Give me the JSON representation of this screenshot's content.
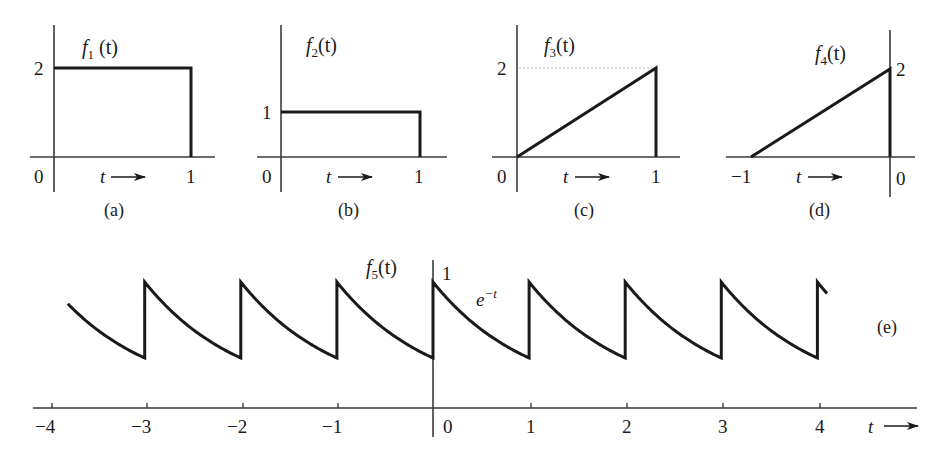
{
  "figure": {
    "panels": [
      {
        "id": "a",
        "caption": "(a)",
        "function_name": "f",
        "function_subscript": "1",
        "function_arg": " (t)",
        "y_tick_label": "2",
        "x_origin_label": "0",
        "x_end_label": "1",
        "t_label": "t"
      },
      {
        "id": "b",
        "caption": "(b)",
        "function_name": "f",
        "function_subscript": "2",
        "function_arg": "(t)",
        "y_tick_label": "1",
        "x_origin_label": "0",
        "x_end_label": "1",
        "t_label": "t"
      },
      {
        "id": "c",
        "caption": "(c)",
        "function_name": "f",
        "function_subscript": "3",
        "function_arg": "(t)",
        "y_tick_label": "2",
        "x_origin_label": "0",
        "x_end_label": "1",
        "t_label": "t"
      },
      {
        "id": "d",
        "caption": "(d)",
        "function_name": "f",
        "function_subscript": "4",
        "function_arg": "(t)",
        "y_tick_label": "2",
        "x_start_label": "−1",
        "x_origin_label": "0",
        "t_label": "t"
      },
      {
        "id": "e",
        "caption": "(e)",
        "function_name": "f",
        "function_subscript": "5",
        "function_arg": "(t)",
        "peak_label": "1",
        "curve_label_base": "e",
        "curve_label_exp": "−t",
        "t_label": "t",
        "x_tick_labels": [
          "−4",
          "−3",
          "−2",
          "−1",
          "0",
          "1",
          "2",
          "3",
          "4"
        ]
      }
    ]
  },
  "chart_data": [
    {
      "type": "line",
      "title": "f1(t)",
      "caption": "(a)",
      "description": "Rectangular pulse of height 2 from t=0 to t=1",
      "x": [
        0,
        0,
        1,
        1
      ],
      "y": [
        0,
        2,
        2,
        0
      ],
      "xlabel": "t",
      "xticks": [
        "0",
        "1"
      ],
      "yticks": [
        "2"
      ]
    },
    {
      "type": "line",
      "title": "f2(t)",
      "caption": "(b)",
      "description": "Rectangular pulse of height 1 from t=0 to t=1",
      "x": [
        0,
        0,
        1,
        1
      ],
      "y": [
        0,
        1,
        1,
        0
      ],
      "xlabel": "t",
      "xticks": [
        "0",
        "1"
      ],
      "yticks": [
        "1"
      ]
    },
    {
      "type": "line",
      "title": "f3(t)",
      "caption": "(c)",
      "description": "Ramp from 0 at t=0 to 2 at t=1, then drops to 0",
      "x": [
        0,
        1,
        1
      ],
      "y": [
        0,
        2,
        0
      ],
      "xlabel": "t",
      "xticks": [
        "0",
        "1"
      ],
      "yticks": [
        "2"
      ]
    },
    {
      "type": "line",
      "title": "f4(t)",
      "caption": "(d)",
      "description": "Ramp from 0 at t=-1 to 2 at t=0, then drops to 0",
      "x": [
        -1,
        0,
        0
      ],
      "y": [
        0,
        2,
        0
      ],
      "xlabel": "t",
      "xticks": [
        "-1",
        "0"
      ],
      "yticks": [
        "2"
      ]
    },
    {
      "type": "line",
      "title": "f5(t)",
      "caption": "(e)",
      "description": "Periodic signal with period 1; each period is e^{-t} decaying from 1 at integer t to e^{-1} just before the next integer",
      "annotation": "e^{-t}",
      "period": 1,
      "x_range": [
        -3.8,
        4.12
      ],
      "peak_value": 1,
      "trough_value": 0.368,
      "jump_points": [
        -3,
        -2,
        -1,
        0,
        1,
        2,
        3,
        4
      ],
      "xlabel": "t",
      "xticks": [
        -4,
        -3,
        -2,
        -1,
        0,
        1,
        2,
        3,
        4
      ],
      "yticks": [
        "1"
      ]
    }
  ]
}
